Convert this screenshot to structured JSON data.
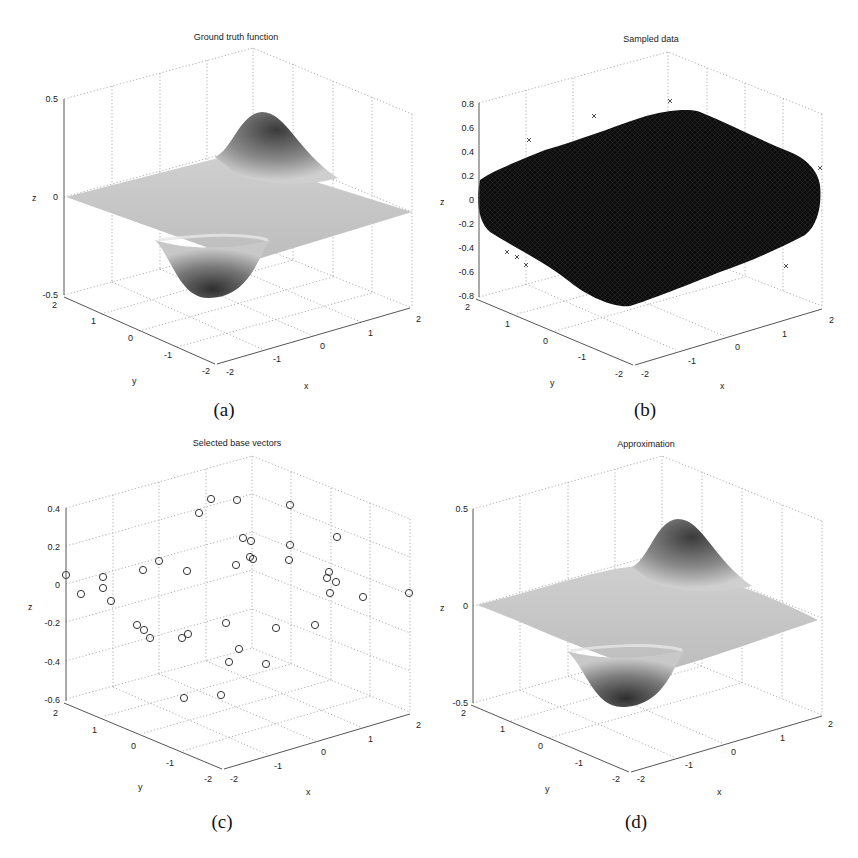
{
  "figure": {
    "panels": [
      {
        "id": "a",
        "title": "Ground truth function",
        "caption": "(a)",
        "xlabel": "x",
        "ylabel": "y",
        "zlabel": "z",
        "zticks": [
          "0.5",
          "0",
          "-0.5"
        ],
        "xticks": [
          "-2",
          "-1",
          "0",
          "1",
          "2"
        ],
        "yticks": [
          "2",
          "1",
          "0",
          "-1",
          "-2"
        ]
      },
      {
        "id": "b",
        "title": "Sampled data",
        "caption": "(b)",
        "xlabel": "x",
        "ylabel": "y",
        "zlabel": "z",
        "zticks": [
          "0.8",
          "0.6",
          "0.4",
          "0.2",
          "0",
          "-0.2",
          "-0.4",
          "-0.6",
          "-0.8"
        ],
        "xticks": [
          "-2",
          "-1",
          "0",
          "1",
          "2"
        ],
        "yticks": [
          "2",
          "1",
          "0",
          "-1",
          "-2"
        ]
      },
      {
        "id": "c",
        "title": "Selected base vectors",
        "caption": "(c)",
        "xlabel": "x",
        "ylabel": "y",
        "zlabel": "z",
        "zticks": [
          "0.4",
          "0.2",
          "0",
          "-0.2",
          "-0.4",
          "-0.6"
        ],
        "xticks": [
          "-2",
          "-1",
          "0",
          "1",
          "2"
        ],
        "yticks": [
          "2",
          "1",
          "0",
          "-1",
          "-2"
        ]
      },
      {
        "id": "d",
        "title": "Approximation",
        "caption": "(d)",
        "xlabel": "x",
        "ylabel": "y",
        "zlabel": "z",
        "zticks": [
          "0.5",
          "0",
          "-0.5"
        ],
        "xticks": [
          "-2",
          "-1",
          "0",
          "1",
          "2"
        ],
        "yticks": [
          "2",
          "1",
          "0",
          "-1",
          "-2"
        ]
      }
    ]
  },
  "chart_data": [
    {
      "type": "surface",
      "title": "Ground truth function",
      "xlabel": "x",
      "ylabel": "y",
      "zlabel": "z",
      "xlim": [
        -2,
        2
      ],
      "ylim": [
        -2,
        2
      ],
      "zlim": [
        -0.5,
        0.5
      ],
      "grid": true,
      "description": "Smooth surface with one positive peak (~0.45) in the back and one negative trough (~-0.45) in the front; near zero elsewhere",
      "peak": {
        "z": 0.45
      },
      "trough": {
        "z": -0.45
      }
    },
    {
      "type": "scatter3d",
      "title": "Sampled data",
      "xlabel": "x",
      "ylabel": "y",
      "zlabel": "z",
      "marker": "x",
      "xlim": [
        -2,
        2
      ],
      "ylim": [
        -2,
        2
      ],
      "zlim": [
        -0.8,
        0.8
      ],
      "grid": true,
      "description": "Dense cloud of noisy samples of the ground truth function over [-2,2]x[-2,2], z roughly between -0.75 and 0.75"
    },
    {
      "type": "scatter3d",
      "title": "Selected base vectors",
      "xlabel": "x",
      "ylabel": "y",
      "zlabel": "z",
      "marker": "o",
      "xlim": [
        -2,
        2
      ],
      "ylim": [
        -2,
        2
      ],
      "zlim": [
        -0.6,
        0.4
      ],
      "grid": true,
      "points_screen": [
        [
          66,
          575
        ],
        [
          81,
          594
        ],
        [
          103,
          577
        ],
        [
          103,
          588
        ],
        [
          111,
          601
        ],
        [
          143,
          570
        ],
        [
          159,
          561
        ],
        [
          187,
          571
        ],
        [
          199,
          513
        ],
        [
          211,
          499
        ],
        [
          237,
          500
        ],
        [
          243,
          538
        ],
        [
          251,
          541
        ],
        [
          236,
          565
        ],
        [
          250,
          557
        ],
        [
          253,
          559
        ],
        [
          290,
          505
        ],
        [
          290,
          545
        ],
        [
          289,
          560
        ],
        [
          337,
          537
        ],
        [
          336,
          582
        ],
        [
          330,
          593
        ],
        [
          327,
          578
        ],
        [
          329,
          572
        ],
        [
          276,
          628
        ],
        [
          315,
          625
        ],
        [
          363,
          597
        ],
        [
          409,
          593
        ],
        [
          137,
          625
        ],
        [
          144,
          630
        ],
        [
          150,
          638
        ],
        [
          182,
          638
        ],
        [
          188,
          634
        ],
        [
          226,
          623
        ],
        [
          239,
          649
        ],
        [
          229,
          662
        ],
        [
          266,
          664
        ],
        [
          184,
          698
        ],
        [
          221,
          695
        ]
      ],
      "point_count": 39
    },
    {
      "type": "surface",
      "title": "Approximation",
      "xlabel": "x",
      "ylabel": "y",
      "zlabel": "z",
      "xlim": [
        -2,
        2
      ],
      "ylim": [
        -2,
        2
      ],
      "zlim": [
        -0.5,
        0.5
      ],
      "grid": true,
      "description": "Reconstructed surface closely matching the ground truth: positive peak (~0.45) behind, negative trough (~-0.45) in front",
      "peak": {
        "z": 0.45
      },
      "trough": {
        "z": -0.45
      }
    }
  ]
}
